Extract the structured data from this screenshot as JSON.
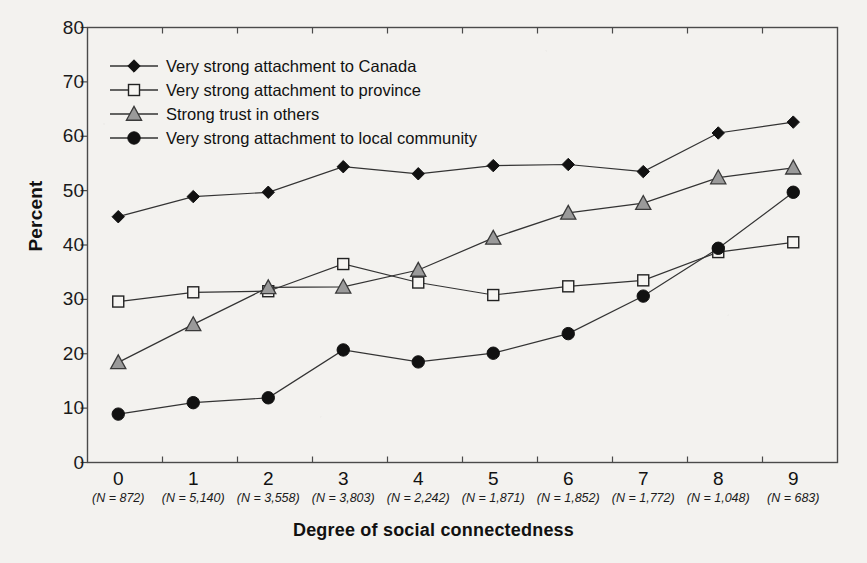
{
  "chart_data": {
    "type": "line",
    "title": "",
    "xlabel": "Degree of social connectedness",
    "ylabel": "Percent",
    "categories": [
      "0",
      "1",
      "2",
      "3",
      "4",
      "5",
      "6",
      "7",
      "8",
      "9"
    ],
    "category_sublabels": [
      "(N = 872)",
      "(N = 5,140)",
      "(N = 3,558)",
      "(N = 3,803)",
      "(N = 2,242)",
      "(N = 1,871)",
      "(N = 1,852)",
      "(N = 1,772)",
      "(N = 1,048)",
      "(N = 683)"
    ],
    "ylim": [
      0,
      80
    ],
    "yticks": [
      0,
      10,
      20,
      30,
      40,
      50,
      60,
      70,
      80
    ],
    "grid": false,
    "legend_position": "top-left",
    "series": [
      {
        "name": "Very strong attachment to Canada",
        "marker": "filled-diamond",
        "color": "#000000",
        "values": [
          45.2,
          48.9,
          49.7,
          54.4,
          53.1,
          54.6,
          54.8,
          53.5,
          60.6,
          62.6
        ]
      },
      {
        "name": "Very strong attachment to province",
        "marker": "open-square",
        "color": "#000000",
        "values": [
          29.6,
          31.3,
          31.5,
          36.5,
          33.1,
          30.8,
          32.4,
          33.5,
          38.7,
          40.5
        ]
      },
      {
        "name": "Strong trust in others",
        "marker": "filled-triangle",
        "color": "#8a8a8a",
        "values": [
          18.4,
          25.4,
          32.2,
          32.3,
          35.4,
          41.3,
          45.9,
          47.7,
          52.4,
          54.2
        ]
      },
      {
        "name": "Very strong attachment to local community",
        "marker": "filled-circle",
        "color": "#000000",
        "values": [
          8.9,
          11.0,
          11.9,
          20.7,
          18.5,
          20.1,
          23.7,
          30.6,
          39.4,
          49.7
        ]
      }
    ]
  },
  "figure": {
    "background_color": "#f3f2ef",
    "axis_color": "#444444"
  }
}
